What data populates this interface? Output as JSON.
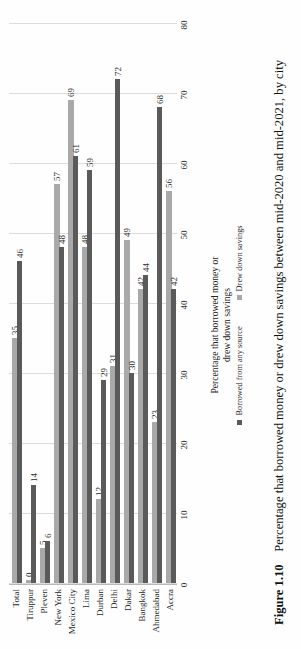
{
  "figure": {
    "number_label": "Figure 1.10",
    "caption": "Percentage that borrowed money or drew down savings between mid-2020 and mid-2021, by city"
  },
  "colors": {
    "series_borrowed": "#5a5a5a",
    "series_savings": "#a9a9a9",
    "gridline": "#dcdcdc",
    "axis": "#a8a8a8",
    "text": "#1f1f1f",
    "page_background": "#ffffff"
  },
  "legend": {
    "position": "bottom",
    "items": [
      {
        "label": "Borrowed from any source",
        "color": "#5a5a5a"
      },
      {
        "label": "Drew down savings",
        "color": "#a9a9a9"
      }
    ]
  },
  "axis": {
    "value_axis_title": "Percentage that borrowed money or drew down savings",
    "value_axis_title_line1": "Percentage that borrowed money or",
    "value_axis_title_line2": "drew down savings",
    "tick_labels": [
      "0",
      "10",
      "20",
      "30",
      "40",
      "50",
      "60",
      "70",
      "80"
    ]
  },
  "chart_data": {
    "type": "bar",
    "orientation": "horizontal",
    "title": "",
    "subtitle": "",
    "xlabel": "Percentage that borrowed money or drew down savings",
    "ylabel": "",
    "xlim": [
      0,
      80
    ],
    "grid": true,
    "legend_position": "bottom",
    "categories": [
      "Accra",
      "Ahmedabad",
      "Bangkok",
      "Dakar",
      "Delhi",
      "Durban",
      "Lima",
      "Mexico City",
      "New York",
      "Pleven",
      "Tiruppur",
      "Total"
    ],
    "tick_labels": [
      "0",
      "10",
      "20",
      "30",
      "40",
      "50",
      "60",
      "70",
      "80"
    ],
    "series": [
      {
        "name": "Borrowed from any source",
        "color": "#5a5a5a",
        "values": [
          42,
          68,
          44,
          30,
          72,
          29,
          59,
          61,
          48,
          6,
          14,
          46
        ]
      },
      {
        "name": "Drew down savings",
        "color": "#a9a9a9",
        "values": [
          56,
          23,
          42,
          49,
          31,
          12,
          48,
          69,
          57,
          5,
          0,
          35
        ]
      }
    ],
    "data_labels": [
      {
        "category": "Accra",
        "borrowed": "42",
        "savings": "56"
      },
      {
        "category": "Ahmedabad",
        "borrowed": "68",
        "savings": "23"
      },
      {
        "category": "Bangkok",
        "borrowed": "44",
        "savings": "42"
      },
      {
        "category": "Dakar",
        "borrowed": "30",
        "savings": "49"
      },
      {
        "category": "Delhi",
        "borrowed": "72",
        "savings": "31"
      },
      {
        "category": "Durban",
        "borrowed": "29",
        "savings": "12"
      },
      {
        "category": "Lima",
        "borrowed": "59",
        "savings": "48"
      },
      {
        "category": "Mexico City",
        "borrowed": "61",
        "savings": "69"
      },
      {
        "category": "New York",
        "borrowed": "48",
        "savings": "57"
      },
      {
        "category": "Pleven",
        "borrowed": "6",
        "savings": "5"
      },
      {
        "category": "Tiruppur",
        "borrowed": "14",
        "savings": "0"
      },
      {
        "category": "Total",
        "borrowed": "46",
        "savings": "35"
      }
    ]
  }
}
